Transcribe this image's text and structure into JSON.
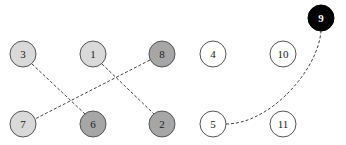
{
  "diagram": {
    "title": "",
    "node_radius": 13,
    "colors": {
      "light": "#d9d9d9",
      "medium": "#a6a6a6",
      "white": "#ffffff",
      "black": "#000000",
      "stroke": "#555555",
      "edge": "#444444"
    },
    "nodes": [
      {
        "id": "3",
        "label": "3",
        "x": 23,
        "y": 54,
        "fill": "#d9d9d9",
        "text": "#222222"
      },
      {
        "id": "1",
        "label": "1",
        "x": 93,
        "y": 54,
        "fill": "#d9d9d9",
        "text": "#222222"
      },
      {
        "id": "8",
        "label": "8",
        "x": 162,
        "y": 54,
        "fill": "#a6a6a6",
        "text": "#222222"
      },
      {
        "id": "4",
        "label": "4",
        "x": 213,
        "y": 54,
        "fill": "#ffffff",
        "text": "#222222"
      },
      {
        "id": "10",
        "label": "10",
        "x": 283,
        "y": 54,
        "fill": "#ffffff",
        "text": "#222222"
      },
      {
        "id": "9",
        "label": "9",
        "x": 321,
        "y": 18,
        "fill": "#000000",
        "text": "#ffffff"
      },
      {
        "id": "7",
        "label": "7",
        "x": 23,
        "y": 124,
        "fill": "#d9d9d9",
        "text": "#222222"
      },
      {
        "id": "6",
        "label": "6",
        "x": 93,
        "y": 124,
        "fill": "#a6a6a6",
        "text": "#222222"
      },
      {
        "id": "2",
        "label": "2",
        "x": 162,
        "y": 124,
        "fill": "#a6a6a6",
        "text": "#222222"
      },
      {
        "id": "5",
        "label": "5",
        "x": 213,
        "y": 124,
        "fill": "#ffffff",
        "text": "#222222"
      },
      {
        "id": "11",
        "label": "11",
        "x": 283,
        "y": 124,
        "fill": "#ffffff",
        "text": "#222222"
      }
    ],
    "edges": [
      {
        "from": "3",
        "to": "6",
        "style": "dashed",
        "path": "M32,64 L85,114"
      },
      {
        "from": "1",
        "to": "2",
        "style": "dashed",
        "path": "M102,64 L154,114"
      },
      {
        "from": "8",
        "to": "7",
        "style": "dashed",
        "path": "M150,60 L35,119"
      },
      {
        "from": "5",
        "to": "9",
        "style": "dashed",
        "path": "M226,124 C270,124 318,70 321,31"
      }
    ]
  }
}
